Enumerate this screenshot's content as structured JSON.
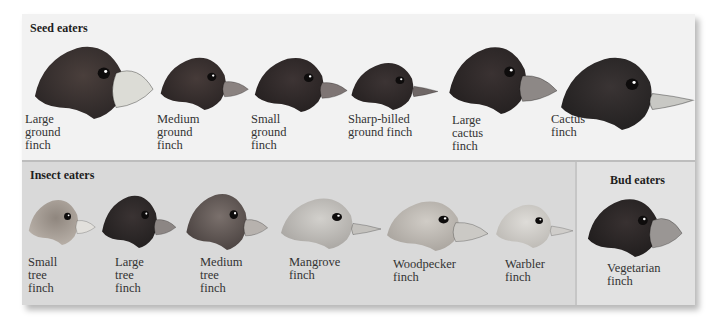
{
  "groups": {
    "seed": {
      "title": "Seed eaters"
    },
    "insect": {
      "title": "Insect eaters"
    },
    "bud": {
      "title": "Bud eaters"
    }
  },
  "birds": [
    {
      "id": "large-ground-finch",
      "name": "Large\nground\nfinch",
      "group": "seed",
      "x": 30,
      "y": 39,
      "w": 128,
      "h": 80,
      "plumage": "#2b2626",
      "plumage2": "#4a3f3c",
      "beak": "#dcdcd6",
      "beak_shape": "huge"
    },
    {
      "id": "medium-ground-finch",
      "name": "Medium\nground\nfinch",
      "group": "seed",
      "x": 157,
      "y": 52,
      "w": 95,
      "h": 58,
      "plumage": "#2a2424",
      "plumage2": "#463b39",
      "beak": "#8a8280",
      "beak_shape": "medium"
    },
    {
      "id": "small-ground-finch",
      "name": "Small\nground\nfinch",
      "group": "seed",
      "x": 251,
      "y": 52,
      "w": 100,
      "h": 60,
      "plumage": "#252020",
      "plumage2": "#3d3434",
      "beak": "#7e7574",
      "beak_shape": "medium"
    },
    {
      "id": "sharp-billed-ground-finch",
      "name": "Sharp-billed\nground finch",
      "group": "seed",
      "x": 348,
      "y": 58,
      "w": 90,
      "h": 52,
      "plumage": "#262121",
      "plumage2": "#3c3434",
      "beak": "#6f6766",
      "beak_shape": "sharp"
    },
    {
      "id": "large-cactus-finch",
      "name": "Large\ncactus\nfinch",
      "group": "seed",
      "x": 445,
      "y": 40,
      "w": 112,
      "h": 74,
      "plumage": "#242020",
      "plumage2": "#3a3232",
      "beak": "#8d8886",
      "beak_shape": "long"
    },
    {
      "id": "cactus-finch",
      "name": "Cactus\nfinch",
      "group": "seed",
      "x": 556,
      "y": 50,
      "w": 132,
      "h": 80,
      "plumage": "#222020",
      "plumage2": "#3a3434",
      "beak": "#c8c8c4",
      "beak_shape": "pointed"
    },
    {
      "id": "small-tree-finch",
      "name": "Small\ntree\nfinch",
      "group": "insect",
      "x": 26,
      "y": 195,
      "w": 72,
      "h": 50,
      "plumage": "#b9b1a9",
      "plumage2": "#8f867e",
      "beak": "#e2e0dc",
      "beak_shape": "medium"
    },
    {
      "id": "large-tree-finch",
      "name": "Large\ntree\nfinch",
      "group": "insect",
      "x": 99,
      "y": 190,
      "w": 80,
      "h": 58,
      "plumage": "#221f1f",
      "plumage2": "#3a3333",
      "beak": "#8c8684",
      "beak_shape": "medium"
    },
    {
      "id": "medium-tree-finch",
      "name": "Medium\ntree\nfinch",
      "group": "insect",
      "x": 183,
      "y": 188,
      "w": 88,
      "h": 62,
      "plumage": "#4a4240",
      "plumage2": "#7a706c",
      "beak": "#b7b2ae",
      "beak_shape": "medium"
    },
    {
      "id": "mangrove-finch",
      "name": "Mangrove\nfinch",
      "group": "insect",
      "x": 277,
      "y": 193,
      "w": 104,
      "h": 56,
      "plumage": "#a9a6a2",
      "plumage2": "#d2d0cc",
      "beak": "#c3c1bd",
      "beak_shape": "sharp"
    },
    {
      "id": "woodpecker-finch",
      "name": "Woodpecker\nfinch",
      "group": "insect",
      "x": 383,
      "y": 196,
      "w": 105,
      "h": 55,
      "plumage": "#a9a49e",
      "plumage2": "#d0ccc6",
      "beak": "#cbc9c5",
      "beak_shape": "long"
    },
    {
      "id": "warbler-finch",
      "name": "Warbler\nfinch",
      "group": "insect",
      "x": 493,
      "y": 200,
      "w": 80,
      "h": 48,
      "plumage": "#bdbab5",
      "plumage2": "#dedcd8",
      "beak": "#cfcdca",
      "beak_shape": "sharp"
    },
    {
      "id": "vegetarian-finch",
      "name": "Vegetarian\nfinch",
      "group": "bud",
      "x": 584,
      "y": 193,
      "w": 102,
      "h": 64,
      "plumage": "#201d1d",
      "plumage2": "#383131",
      "beak": "#9a9694",
      "beak_shape": "huge"
    }
  ],
  "label_positions": [
    {
      "x": 25,
      "y": 113
    },
    {
      "x": 157,
      "y": 113
    },
    {
      "x": 251,
      "y": 113
    },
    {
      "x": 348,
      "y": 113
    },
    {
      "x": 452,
      "y": 114
    },
    {
      "x": 551,
      "y": 113
    },
    {
      "x": 28,
      "y": 256
    },
    {
      "x": 115,
      "y": 256
    },
    {
      "x": 200,
      "y": 256
    },
    {
      "x": 289,
      "y": 256
    },
    {
      "x": 393,
      "y": 258
    },
    {
      "x": 505,
      "y": 258
    },
    {
      "x": 607,
      "y": 262
    }
  ]
}
